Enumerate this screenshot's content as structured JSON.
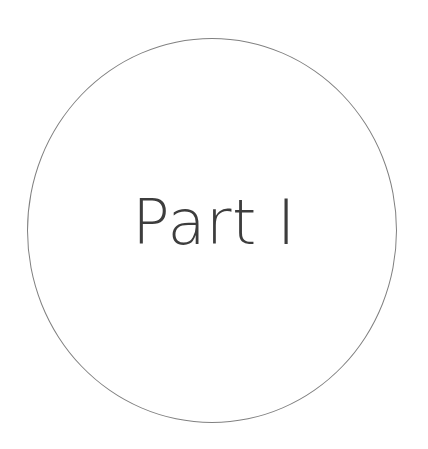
{
  "page": {
    "kind": "book-part-divider",
    "background_color": "#ffffff",
    "width": 428,
    "height": 449
  },
  "divider": {
    "circle": {
      "name": "decorative-circle",
      "stroke_color": "#808080",
      "stroke_width_px": 1,
      "fill": "none",
      "center_x": 212,
      "center_y": 230,
      "width_px": 370,
      "height_px": 385
    },
    "label": {
      "text": "Part I",
      "color": "#3d3d3d",
      "font_size_px": 62,
      "font_weight": "light",
      "align": "center"
    }
  }
}
